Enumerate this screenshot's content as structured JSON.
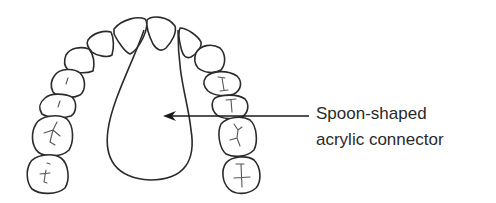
{
  "figure": {
    "stroke_color": "#2b2b2b",
    "fissure_color": "#555555",
    "background": "#ffffff"
  },
  "annotation": {
    "line1": "Spoon-shaped",
    "line2": "acrylic connector",
    "arrow_icon": "arrow-left-icon"
  }
}
